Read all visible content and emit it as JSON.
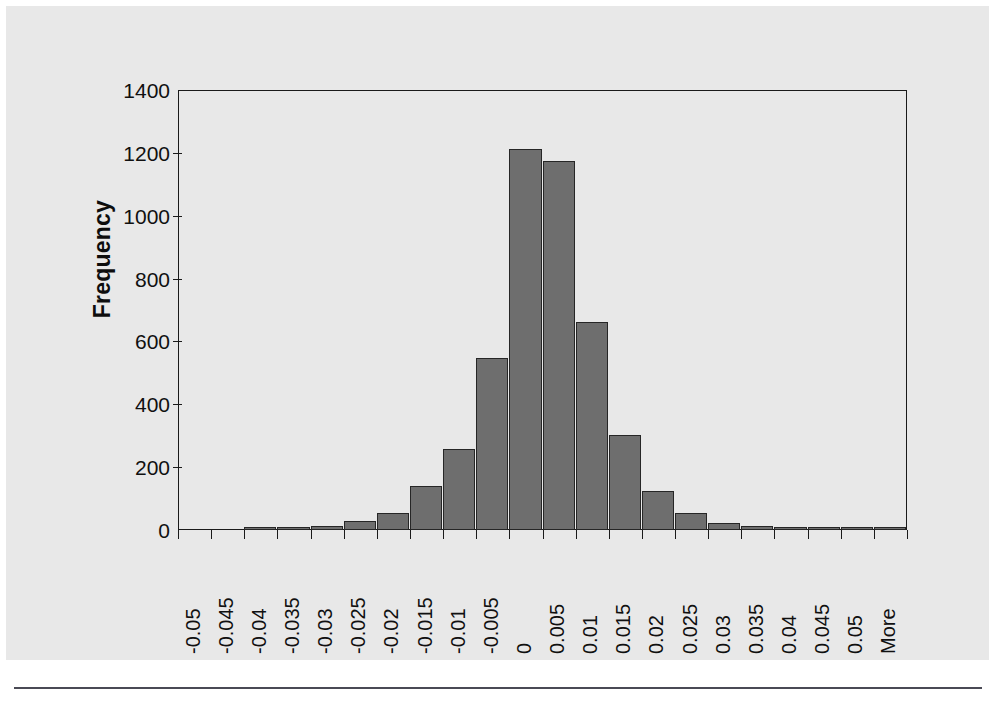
{
  "figure": {
    "y_axis_title": "Frequency",
    "background_color": "#e8e8e8",
    "bar_fill_color": "#6e6e6e",
    "bar_border_color": "#262626",
    "axis_color": "#1a1a1a"
  },
  "chart_data": {
    "type": "bar",
    "title": "",
    "xlabel": "",
    "ylabel": "Frequency",
    "categories": [
      "-0.05",
      "-0.045",
      "-0.04",
      "-0.035",
      "-0.03",
      "-0.025",
      "-0.02",
      "-0.015",
      "-0.01",
      "-0.005",
      "0",
      "0.005",
      "0.01",
      "0.015",
      "0.02",
      "0.025",
      "0.03",
      "0.035",
      "0.04",
      "0.045",
      "0.05",
      "More"
    ],
    "values": [
      0,
      0,
      2,
      5,
      14,
      28,
      53,
      140,
      258,
      547,
      1212,
      1175,
      661,
      303,
      125,
      54,
      22,
      13,
      8,
      4,
      5,
      2
    ],
    "ylim": [
      0,
      1400
    ],
    "ytick_values": [
      0,
      200,
      400,
      600,
      800,
      1000,
      1200,
      1400
    ],
    "ytick_labels": [
      "0",
      "200",
      "400",
      "600",
      "800",
      "1000",
      "1200",
      "1400"
    ],
    "grid": false,
    "legend": false,
    "legend_position": "none"
  }
}
